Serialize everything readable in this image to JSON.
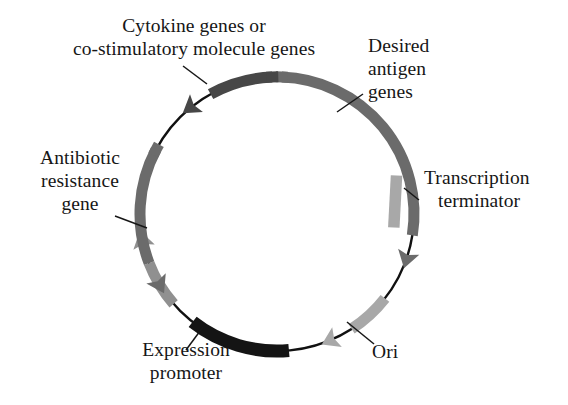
{
  "figure": {
    "kind": "plasmid-map",
    "background_color": "#ffffff",
    "backbone_color": "#111111",
    "center": {
      "x": 277,
      "y": 214
    },
    "radius": 137
  },
  "labels": {
    "cytokine": {
      "line1": "Cytokine genes or",
      "line2": "co-stimulatory molecule genes"
    },
    "antigen": {
      "line1": "Desired",
      "line2": "antigen",
      "line3": "genes"
    },
    "terminator": {
      "line1": "Transcription",
      "line2": "terminator"
    },
    "antibiotic": {
      "line1": "Antibiotic",
      "line2": "resistance",
      "line3": "gene"
    },
    "promoter": {
      "line1": "Expression",
      "line2": "promoter"
    },
    "ori": {
      "line1": "Ori"
    }
  },
  "features": [
    {
      "id": "desired-antigen-genes",
      "name": "Desired antigen genes",
      "color": "#6b6b6b",
      "start_angle_deg": -88,
      "end_angle_deg": 16,
      "direction": "clockwise",
      "arrowhead": true,
      "thickness": 11
    },
    {
      "id": "transcription-terminator",
      "name": "Transcription terminator",
      "color": "#a8a8a8",
      "start_angle_deg": 38,
      "end_angle_deg": 64,
      "direction": "clockwise",
      "arrowhead": true,
      "thickness": 11
    },
    {
      "id": "ori",
      "name": "Ori",
      "color": "#141414",
      "start_angle_deg": 85,
      "end_angle_deg": 128,
      "direction": "clockwise",
      "arrowhead": false,
      "thickness": 13
    },
    {
      "id": "expression-promoter",
      "name": "Expression promoter",
      "color": "#909090",
      "start_angle_deg": 139,
      "end_angle_deg": 166,
      "direction": "counter-drawn-clockwise",
      "arrowhead": true,
      "thickness": 11
    },
    {
      "id": "antibiotic-resistance-gene",
      "name": "Antibiotic resistance gene",
      "color": "#6b6b6b",
      "start_angle_deg": 208,
      "end_angle_deg": 152,
      "direction": "counterclockwise",
      "arrowhead": true,
      "thickness": 11
    },
    {
      "id": "cytokine-genes",
      "name": "Cytokine genes or co-stimulatory molecule genes",
      "color": "#474747",
      "start_angle_deg": 268,
      "end_angle_deg": 234,
      "direction": "counterclockwise",
      "arrowhead": true,
      "thickness": 11
    }
  ],
  "leader_lines": [
    {
      "id": "leader-cytokine",
      "from": {
        "x": 183,
        "y": 66
      },
      "to": {
        "x": 207,
        "y": 84
      }
    },
    {
      "id": "leader-antigen",
      "from": {
        "x": 363,
        "y": 94
      },
      "to": {
        "x": 337,
        "y": 112
      }
    },
    {
      "id": "leader-terminator",
      "from": {
        "x": 419,
        "y": 200
      },
      "to": {
        "x": 404,
        "y": 188
      }
    },
    {
      "id": "leader-antibiotic",
      "from": {
        "x": 115,
        "y": 216
      },
      "to": {
        "x": 147,
        "y": 228
      }
    },
    {
      "id": "leader-promoter",
      "from": {
        "x": 186,
        "y": 350
      },
      "to": {
        "x": 203,
        "y": 327
      }
    },
    {
      "id": "leader-ori",
      "from": {
        "x": 374,
        "y": 344
      },
      "to": {
        "x": 347,
        "y": 322
      }
    }
  ]
}
